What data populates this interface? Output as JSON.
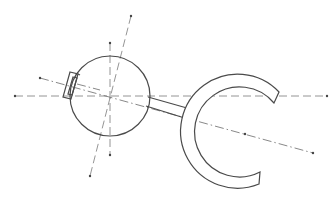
{
  "figure": {
    "type": "technical line drawing",
    "colors": {
      "background": "#ffffff",
      "outline": "#4a4a4a",
      "axis_lines": "#7a7a7a"
    },
    "components": [
      {
        "name": "sphere",
        "shape": "circle",
        "center": [
          110,
          96
        ],
        "radius": 40
      },
      {
        "name": "tab",
        "shape": "rectangle",
        "position": "left side of sphere"
      },
      {
        "name": "rod",
        "shape": "bar",
        "from": [
          146,
          100
        ],
        "to": [
          193,
          118
        ]
      },
      {
        "name": "c-ring",
        "shape": "arc",
        "center": [
          250,
          127
        ],
        "outer_radius": 57,
        "inner_radius": 45,
        "opening": "right"
      }
    ],
    "axes": [
      {
        "name": "horizontal-axis",
        "from": [
          15,
          96
        ],
        "to": [
          327,
          96
        ],
        "style": "dashed"
      },
      {
        "name": "vertical-axis",
        "from": [
          110,
          43
        ],
        "to": [
          110,
          155
        ],
        "style": "dashed"
      },
      {
        "name": "tilted-axis",
        "from": [
          130,
          16
        ],
        "to": [
          90,
          175
        ],
        "style": "dashed"
      },
      {
        "name": "diagonal-axis",
        "from": [
          40,
          78
        ],
        "to": [
          313,
          153
        ],
        "style": "dash-dot",
        "midpoint_dot": [
          245,
          134
        ]
      }
    ]
  }
}
